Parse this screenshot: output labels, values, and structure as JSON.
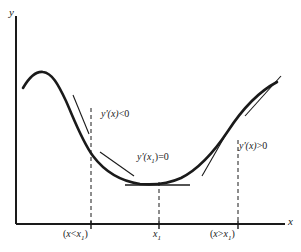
{
  "figure": {
    "type": "calculus-derivative-sign-diagram",
    "background_color": "#ffffff",
    "ink_color": "#1a1a1a",
    "axes": {
      "y_label": "y",
      "x_label": "x",
      "x_axis_y_px": 224,
      "y_axis_x_px": 16,
      "x_axis_left_px": 16,
      "x_axis_right_px": 285,
      "y_axis_top_px": 16
    },
    "annotations": [
      {
        "id": "left-region",
        "text_prefix": "y'(x)",
        "operator": "<",
        "value": "0",
        "full_text": "y'(x) < 0",
        "x_px": 101,
        "y_px": 109
      },
      {
        "id": "critical-point",
        "text_prefix": "y'(x",
        "subscript": "1",
        "text_suffix": ")",
        "operator": "=",
        "value": "0",
        "full_text": "y'(x1) = 0",
        "x_px": 137,
        "y_px": 152
      },
      {
        "id": "right-region",
        "text_prefix": "y'(x)",
        "operator": ">",
        "value": "0",
        "full_text": "y'(x) > 0",
        "x_px": 239,
        "y_px": 141
      }
    ],
    "x_ticks": [
      {
        "id": "left-tick",
        "label_open": "(",
        "label_var": "x",
        "label_op": "<",
        "label_var2": "x",
        "label_sub": "1",
        "label_close": ")",
        "full_label": "(x < x1)",
        "x_px": 91,
        "label_x_px": 63,
        "label_y_px": 229,
        "dash_top_px": 108
      },
      {
        "id": "min-tick",
        "label_var": "x",
        "label_sub": "1",
        "full_label": "x1",
        "x_px": 159,
        "label_x_px": 153,
        "label_y_px": 229,
        "dash_top_px": 182
      },
      {
        "id": "right-tick",
        "label_open": "(",
        "label_var": "x",
        "label_op": ">",
        "label_var2": "x",
        "label_sub": "1",
        "label_close": ")",
        "full_label": "(x > x1)",
        "x_px": 238,
        "label_x_px": 210,
        "label_y_px": 229,
        "dash_top_px": 140
      }
    ],
    "curve": {
      "description": "cubic-like curve with local max on left and local min at x1",
      "path": "M 23,88 C 30,76 36,71 43,72 C 52,73 58,84 66,101 C 74,119 82,141 93,156 C 105,172 120,181 140,184 C 152,185 168,184 181,178 C 197,170 212,155 228,131 C 243,108 258,92 277,82",
      "stroke_width": 2.6
    },
    "tangents": [
      {
        "id": "tangent-negative-upper",
        "x1": 73,
        "y1": 95,
        "x2": 89,
        "y2": 134,
        "slope_sign": "negative"
      },
      {
        "id": "tangent-negative-lower",
        "x1": 100,
        "y1": 152,
        "x2": 134,
        "y2": 175,
        "slope_sign": "negative"
      },
      {
        "id": "tangent-zero",
        "x1": 125,
        "y1": 185,
        "x2": 190,
        "y2": 185,
        "slope_sign": "zero"
      },
      {
        "id": "tangent-positive-lower",
        "x1": 202,
        "y1": 175,
        "x2": 228,
        "y2": 130,
        "slope_sign": "positive"
      },
      {
        "id": "tangent-positive-upper",
        "x1": 245,
        "y1": 115,
        "x2": 280,
        "y2": 77,
        "slope_sign": "positive"
      }
    ]
  }
}
